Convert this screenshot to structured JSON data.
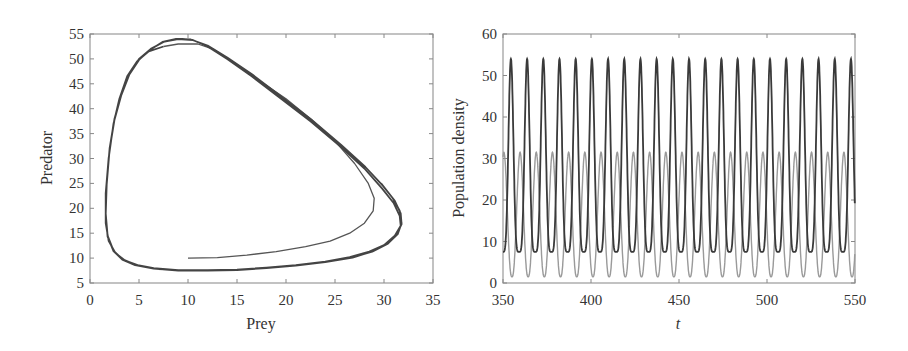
{
  "chart_data": [
    {
      "id": "phase-plane",
      "type": "line",
      "title": "",
      "xlabel": "Prey",
      "ylabel": "Predator",
      "xlim": [
        0,
        35
      ],
      "ylim": [
        5,
        55
      ],
      "xticks": [
        0,
        5,
        10,
        15,
        20,
        25,
        30,
        35
      ],
      "yticks": [
        5,
        10,
        15,
        20,
        25,
        30,
        35,
        40,
        45,
        50,
        55
      ],
      "grid": false,
      "legend": null,
      "description": "Phase-plane trajectory spiralling out from (10,10) onto a limit cycle",
      "series": [
        {
          "name": "transient",
          "color": "#555555",
          "points": [
            [
              10,
              10
            ],
            [
              13,
              10.1
            ],
            [
              16,
              10.6
            ],
            [
              19,
              11.3
            ],
            [
              22,
              12.3
            ],
            [
              24.5,
              13.4
            ],
            [
              26.5,
              15
            ],
            [
              28,
              17
            ],
            [
              28.9,
              19.5
            ],
            [
              29,
              22
            ],
            [
              28.4,
              25
            ],
            [
              27,
              29
            ],
            [
              25,
              33.5
            ],
            [
              22.5,
              38
            ],
            [
              20,
              42
            ],
            [
              17,
              46
            ],
            [
              14.5,
              49.5
            ],
            [
              12.5,
              52
            ],
            [
              11,
              53
            ],
            [
              9,
              53
            ],
            [
              7.5,
              52.5
            ]
          ]
        },
        {
          "name": "limit-cycle",
          "color": "#444444",
          "points": [
            [
              7.5,
              52.5
            ],
            [
              6,
              51.5
            ],
            [
              4.8,
              49.5
            ],
            [
              3.8,
              46.5
            ],
            [
              3,
              42
            ],
            [
              2.4,
              37
            ],
            [
              1.9,
              30
            ],
            [
              1.6,
              23
            ],
            [
              1.6,
              17
            ],
            [
              1.9,
              13.5
            ],
            [
              2.6,
              11
            ],
            [
              3.6,
              9.5
            ],
            [
              5,
              8.5
            ],
            [
              7,
              7.8
            ],
            [
              9,
              7.6
            ],
            [
              12,
              7.6
            ],
            [
              15,
              7.7
            ],
            [
              18,
              8.1
            ],
            [
              21,
              8.6
            ],
            [
              24,
              9.3
            ],
            [
              26.5,
              10.2
            ],
            [
              28.5,
              11.3
            ],
            [
              30,
              12.6
            ],
            [
              31.1,
              14.5
            ],
            [
              31.7,
              16.5
            ],
            [
              31.6,
              18.5
            ],
            [
              31,
              21
            ],
            [
              29.8,
              24
            ],
            [
              28,
              28
            ],
            [
              25.5,
              32.5
            ],
            [
              22.5,
              37.5
            ],
            [
              19.5,
              42
            ],
            [
              16.5,
              46.5
            ],
            [
              14,
              50
            ],
            [
              12,
              52.5
            ],
            [
              10.5,
              53.8
            ],
            [
              9,
              54
            ],
            [
              7.6,
              53.5
            ],
            [
              6.2,
              52
            ],
            [
              5,
              50
            ],
            [
              4,
              47
            ],
            [
              3.2,
              43
            ],
            [
              2.5,
              38
            ],
            [
              2,
              32
            ],
            [
              1.7,
              25
            ],
            [
              1.6,
              19
            ],
            [
              1.8,
              14.5
            ],
            [
              2.4,
              11.5
            ],
            [
              3.3,
              9.8
            ],
            [
              4.6,
              8.7
            ],
            [
              6.5,
              8
            ],
            [
              9,
              7.6
            ],
            [
              12,
              7.5
            ],
            [
              15,
              7.6
            ],
            [
              18,
              8
            ],
            [
              21,
              8.5
            ],
            [
              24,
              9.2
            ],
            [
              26.7,
              10.1
            ],
            [
              28.8,
              11.3
            ],
            [
              30.3,
              12.8
            ],
            [
              31.3,
              14.7
            ],
            [
              31.8,
              16.8
            ],
            [
              31.7,
              19
            ],
            [
              31.1,
              21.5
            ],
            [
              29.9,
              24.5
            ],
            [
              28.1,
              28.3
            ],
            [
              25.6,
              32.8
            ],
            [
              22.6,
              37.8
            ],
            [
              19.6,
              42.3
            ],
            [
              16.6,
              46.8
            ],
            [
              14,
              50.3
            ],
            [
              12,
              52.7
            ],
            [
              10.3,
              53.9
            ],
            [
              8.8,
              54
            ],
            [
              7.4,
              53.4
            ],
            [
              6.1,
              51.8
            ],
            [
              5,
              49.8
            ],
            [
              4,
              46.8
            ],
            [
              3.2,
              42.8
            ],
            [
              2.5,
              37.8
            ],
            [
              2,
              31.8
            ],
            [
              1.7,
              24.8
            ],
            [
              1.6,
              18.8
            ],
            [
              1.8,
              14.3
            ],
            [
              2.4,
              11.4
            ],
            [
              3.3,
              9.7
            ],
            [
              4.6,
              8.6
            ],
            [
              6.5,
              7.9
            ],
            [
              9,
              7.5
            ],
            [
              12,
              7.5
            ],
            [
              15,
              7.6
            ],
            [
              18,
              8
            ],
            [
              21,
              8.5
            ],
            [
              24,
              9.2
            ],
            [
              26.8,
              10.1
            ],
            [
              28.9,
              11.4
            ],
            [
              30.4,
              12.9
            ],
            [
              31.4,
              14.8
            ],
            [
              31.8,
              17
            ],
            [
              31.6,
              19.5
            ],
            [
              30.9,
              22
            ],
            [
              29.7,
              25
            ]
          ]
        }
      ]
    },
    {
      "id": "time-series",
      "type": "line",
      "title": "",
      "xlabel": "t",
      "ylabel": "Population density",
      "xlim": [
        350,
        550
      ],
      "ylim": [
        0,
        60
      ],
      "xticks": [
        350,
        400,
        450,
        500,
        550
      ],
      "yticks": [
        0,
        10,
        20,
        30,
        40,
        50,
        60
      ],
      "grid": false,
      "legend": null,
      "period": 9.2,
      "first_predator_peak_t": 354.5,
      "series": [
        {
          "name": "Predator",
          "color": "#3a3a3a",
          "min": 7.5,
          "max": 54,
          "peak_times": [
            354.5,
            363.7,
            372.9,
            382.1,
            391.3,
            400.5,
            409.7,
            418.9,
            428.1,
            437.3,
            446.5,
            455.7,
            464.9,
            474.1,
            483.3,
            492.5,
            501.7,
            510.9,
            520.1,
            529.3,
            538.5,
            547.7
          ]
        },
        {
          "name": "Prey",
          "color": "#9a9a9a",
          "min": 1.5,
          "max": 31.5,
          "peak_times": [
            350.5,
            359.7,
            368.9,
            378.1,
            387.3,
            396.5,
            405.7,
            414.9,
            424.1,
            433.3,
            442.5,
            451.7,
            460.9,
            470.1,
            479.3,
            488.5,
            497.7,
            506.9,
            516.1,
            525.3,
            534.5,
            543.7
          ]
        }
      ]
    }
  ],
  "left": {
    "xlabel": "Prey",
    "ylabel": "Predator",
    "xtick_labels": [
      "0",
      "5",
      "10",
      "15",
      "20",
      "25",
      "30",
      "35"
    ],
    "ytick_labels": [
      "5",
      "10",
      "15",
      "20",
      "25",
      "30",
      "35",
      "40",
      "45",
      "50",
      "55"
    ]
  },
  "right": {
    "xlabel": "t",
    "ylabel": "Population density",
    "xtick_labels": [
      "350",
      "400",
      "450",
      "500",
      "550"
    ],
    "ytick_labels": [
      "0",
      "10",
      "20",
      "30",
      "40",
      "50",
      "60"
    ]
  }
}
